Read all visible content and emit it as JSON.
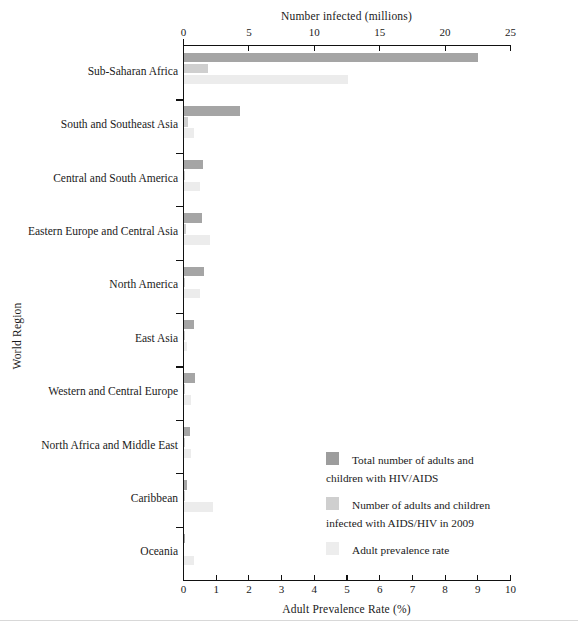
{
  "chart_data": {
    "type": "bar",
    "orientation": "horizontal",
    "title": "",
    "top_axis": {
      "label": "Number infected (millions)",
      "ticks": [
        0,
        5,
        10,
        15,
        20,
        25
      ],
      "lim": [
        0,
        25
      ],
      "position": "top"
    },
    "bottom_axis": {
      "label": "Adult Prevalence Rate (%)",
      "ticks": [
        0,
        1,
        2,
        3,
        4,
        5,
        6,
        7,
        8,
        9,
        10
      ],
      "lim": [
        0,
        10
      ],
      "position": "bottom"
    },
    "ylabel": "World Region",
    "grid": false,
    "legend_position": "inside-lower-right",
    "categories": [
      "Sub-Saharan Africa",
      "South and Southeast Asia",
      "Central and South America",
      "Eastern Europe and Central Asia",
      "North America",
      "East Asia",
      "Western and Central Europe",
      "North Africa and Middle East",
      "Caribbean",
      "Oceania"
    ],
    "series": [
      {
        "name": "Total number of adults and children with HIV/AIDS",
        "legend_label": "Total number of adults and\nchildren with HIV/AIDS",
        "color": "#a5a5a5",
        "axis": "top",
        "unit": "millions",
        "values": [
          22.5,
          4.3,
          1.45,
          1.4,
          1.5,
          0.77,
          0.82,
          0.46,
          0.24,
          0.057
        ]
      },
      {
        "name": "Number of adults and children infected with AIDS/HIV in 2009",
        "legend_label": "Number of adults and children\ninfected with AIDS/HIV in 2009",
        "color": "#cfcfcf",
        "axis": "top",
        "unit": "millions",
        "values": [
          1.8,
          0.27,
          0.092,
          0.13,
          0.07,
          0.082,
          0.031,
          0.075,
          0.017,
          0.0045
        ]
      },
      {
        "name": "Adult prevalence rate",
        "legend_label": "Adult prevalence rate",
        "color": "#ececec",
        "axis": "bottom",
        "unit": "%",
        "values": [
          5.0,
          0.32,
          0.5,
          0.8,
          0.5,
          0.1,
          0.2,
          0.2,
          0.9,
          0.3
        ]
      }
    ]
  },
  "legend": {
    "entries": [
      {
        "label": "Total number of adults and\nchildren with HIV/AIDS",
        "color": "#9d9d9d"
      },
      {
        "label": "Number of adults and children\ninfected with AIDS/HIV in 2009",
        "color": "#cfcfcf"
      },
      {
        "label": "Adult prevalence rate",
        "color": "#ededed"
      }
    ]
  }
}
